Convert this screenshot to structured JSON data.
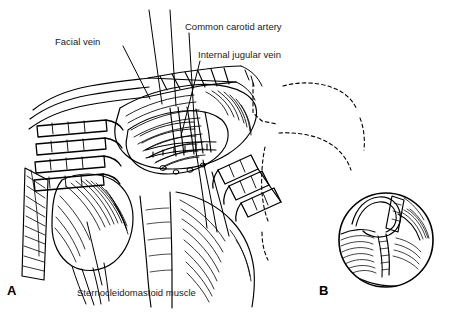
{
  "figure": {
    "type": "anatomical-line-drawing",
    "top_caption": "Fig. 2. Radical neck dissection, technique",
    "line_color": "#000000",
    "background_color": "#ffffff",
    "panels": [
      {
        "id": "A",
        "letter": "A",
        "kind": "main-surgical-field"
      },
      {
        "id": "B",
        "letter": "B",
        "kind": "circular-inset-detail"
      }
    ],
    "annotations": [
      {
        "id": "facial-vein",
        "label": "Facial vein",
        "text_x": 55,
        "text_y": 36,
        "leader": {
          "x1": 123,
          "y1": 46,
          "x2": 150,
          "y2": 99
        }
      },
      {
        "id": "common-carotid-artery",
        "label": "Common carotid artery",
        "text_x": 185,
        "text_y": 21,
        "leader": {
          "x1": 189,
          "y1": 33,
          "x2": 196,
          "y2": 151
        }
      },
      {
        "id": "internal-jugular-vein",
        "label": "Internal jugular vein",
        "text_x": 198,
        "text_y": 49,
        "leader": {
          "x1": 200,
          "y1": 61,
          "x2": 181,
          "y2": 136
        }
      },
      {
        "id": "sternocleidomastoid-muscle",
        "label": "Sternocleidomastoid muscle",
        "text_x": 77,
        "text_y": 287,
        "leader": {
          "x1": 102,
          "y1": 285,
          "x2": 87,
          "y2": 222
        }
      }
    ]
  }
}
